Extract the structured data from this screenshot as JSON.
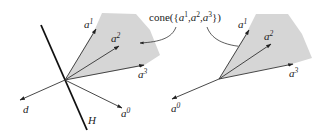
{
  "figure": {
    "annotation": {
      "prefix": "cone({",
      "v1": "a",
      "s1": "1",
      "comma1": ",",
      "v2": "a",
      "s2": "2",
      "comma2": ",",
      "v3": "a",
      "s3": "3",
      "suffix": "})"
    },
    "colors": {
      "cone_fill": "#d6d6d6",
      "line": "#333333",
      "hyperplane": "#111111"
    },
    "left_panel": {
      "vectors": [
        {
          "name": "a",
          "sup": "1"
        },
        {
          "name": "a",
          "sup": "2"
        },
        {
          "name": "a",
          "sup": "3"
        },
        {
          "name": "a",
          "sup": "0"
        },
        {
          "name": "d",
          "sup": ""
        }
      ],
      "hyperplane_label": "H"
    },
    "right_panel": {
      "vectors": [
        {
          "name": "a",
          "sup": "1"
        },
        {
          "name": "a",
          "sup": "2"
        },
        {
          "name": "a",
          "sup": "3"
        },
        {
          "name": "a",
          "sup": "0"
        }
      ]
    }
  }
}
